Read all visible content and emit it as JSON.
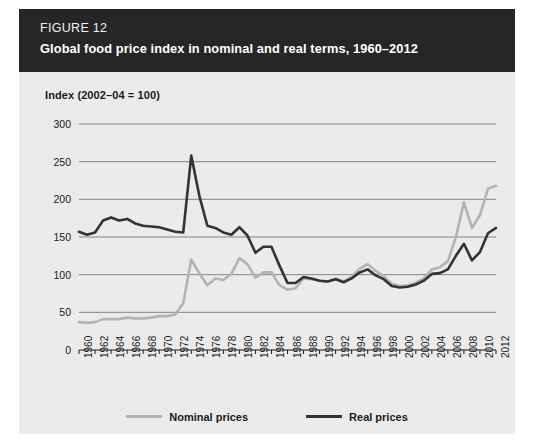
{
  "figure": {
    "label": "FIGURE 12",
    "title": "Global food price index in nominal and real terms, 1960–2012"
  },
  "colors": {
    "header_bg": "#262626",
    "panel_bg": "#ebebeb",
    "grid": "#77777a",
    "nominal": "#b3b3b3",
    "real": "#333333",
    "text": "#1a1a1a"
  },
  "legend": {
    "position": "bottom-center",
    "items": [
      {
        "label": "Nominal prices",
        "color": "#b3b3b3"
      },
      {
        "label": "Real prices",
        "color": "#333333"
      }
    ]
  },
  "chart_data": {
    "type": "line",
    "title": "Global food price index in nominal and real terms, 1960–2012",
    "subtitle": "FIGURE 12",
    "xlabel": "",
    "ylabel": "Index (2002–04 = 100)",
    "ylim": [
      0,
      300
    ],
    "xlim": [
      1960,
      2012
    ],
    "yticks": [
      0,
      50,
      100,
      150,
      200,
      250,
      300
    ],
    "grid": "horizontal",
    "xticks": [
      1960,
      1962,
      1964,
      1966,
      1968,
      1970,
      1972,
      1974,
      1976,
      1978,
      1980,
      1982,
      1984,
      1986,
      1988,
      1990,
      1992,
      1994,
      1996,
      1998,
      2000,
      2002,
      2004,
      2006,
      2008,
      2010,
      2012
    ],
    "xtick_labels": [
      "1960",
      "1962",
      "1964",
      "1966",
      "1968",
      "1970",
      "1972",
      "1974",
      "1976",
      "1978",
      "1980",
      "1982",
      "1984",
      "1986",
      "1988",
      "1990",
      "1992",
      "1994",
      "1996",
      "1998",
      "2000",
      "2002",
      "2004",
      "2006",
      "2008",
      "2010",
      "2012"
    ],
    "x": [
      1960,
      1961,
      1962,
      1963,
      1964,
      1965,
      1966,
      1967,
      1968,
      1969,
      1970,
      1971,
      1972,
      1973,
      1974,
      1975,
      1976,
      1977,
      1978,
      1979,
      1980,
      1981,
      1982,
      1983,
      1984,
      1985,
      1986,
      1987,
      1988,
      1989,
      1990,
      1991,
      1992,
      1993,
      1994,
      1995,
      1996,
      1997,
      1998,
      1999,
      2000,
      2001,
      2002,
      2003,
      2004,
      2005,
      2006,
      2007,
      2008,
      2009,
      2010,
      2011,
      2012
    ],
    "series": [
      {
        "name": "Nominal prices",
        "color": "#b3b3b3",
        "values": [
          37,
          36,
          37,
          41,
          41,
          41,
          43,
          42,
          42,
          43,
          45,
          45,
          47,
          62,
          120,
          102,
          86,
          95,
          93,
          101,
          122,
          114,
          96,
          103,
          103,
          86,
          80,
          82,
          95,
          94,
          92,
          91,
          95,
          91,
          97,
          108,
          114,
          105,
          98,
          88,
          85,
          86,
          89,
          95,
          107,
          110,
          118,
          150,
          196,
          162,
          179,
          214,
          218
        ]
      },
      {
        "name": "Real prices",
        "color": "#333333",
        "values": [
          157,
          153,
          156,
          172,
          176,
          172,
          174,
          168,
          165,
          164,
          163,
          160,
          157,
          156,
          258,
          205,
          165,
          162,
          156,
          153,
          163,
          152,
          129,
          137,
          137,
          112,
          89,
          89,
          97,
          95,
          92,
          91,
          94,
          90,
          95,
          103,
          107,
          99,
          94,
          85,
          83,
          84,
          87,
          92,
          101,
          102,
          107,
          125,
          141,
          119,
          130,
          155,
          162
        ]
      }
    ]
  }
}
